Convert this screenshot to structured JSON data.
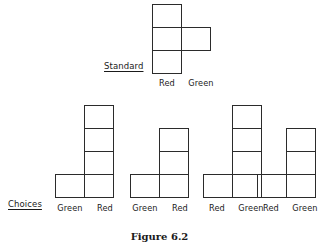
{
  "caption": "Figure 6.2",
  "colors": {
    "ink": "#2b2b2b",
    "text": "#1a1a1a",
    "background": "#ffffff"
  },
  "rows": {
    "standard": {
      "tag": "Standard",
      "figure": {
        "name": "standard-figure",
        "column_labels": [
          "Red",
          "Green"
        ],
        "left_column_height": 3,
        "right_column_height": 1,
        "right_column_row_from_top": 2,
        "description": "Three-cell vertical column under Red with a single cell attached to its right at the middle row"
      }
    },
    "choices": {
      "tag": "Choices",
      "figures": [
        {
          "name": "choice-1",
          "column_labels": [
            "Green",
            "Red"
          ],
          "tall_column": "right",
          "tall_column_height": 4,
          "foot_cell_side": "left",
          "description": "Four-cell column under Red with one cell attached at bottom-left under Green"
        },
        {
          "name": "choice-2",
          "column_labels": [
            "Green",
            "Red"
          ],
          "tall_column": "right",
          "tall_column_height": 3,
          "foot_cell_side": "left",
          "description": "Three-cell column under Red with one cell attached at bottom-left under Green"
        },
        {
          "name": "choice-3",
          "column_labels": [
            "Red",
            "Green"
          ],
          "tall_column": "right",
          "tall_column_height": 4,
          "foot_cell_side": "left",
          "description": "Four-cell column under Green with one cell attached at bottom-left under Red"
        },
        {
          "name": "choice-4",
          "column_labels": [
            "Red",
            "Green"
          ],
          "tall_column": "right",
          "tall_column_height": 3,
          "foot_cell_side": "left",
          "description": "Three-cell column under Green with one cell attached at bottom-left under Red"
        }
      ]
    }
  }
}
